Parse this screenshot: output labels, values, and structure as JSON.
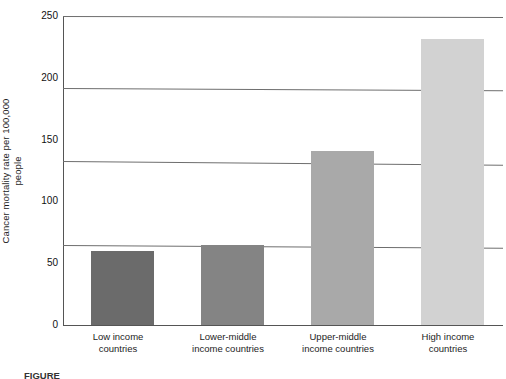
{
  "chart_data": {
    "type": "bar",
    "title": "",
    "xlabel": "",
    "ylabel": "Cancer mortality rate per 100,000\npeople",
    "categories": [
      "Low income\ncountries",
      "Lower-middle\nincome countries",
      "Upper-middle\nincome countries",
      "High income\ncountries"
    ],
    "values": [
      60,
      65,
      141,
      231
    ],
    "ylim": [
      0,
      250
    ],
    "yticks": [
      0,
      50,
      100,
      150,
      200,
      250
    ],
    "ytick_labels": [
      "0",
      "50",
      "100",
      "150",
      "200",
      "250"
    ],
    "gridlines": [
      65,
      133,
      192,
      250
    ],
    "grid": true,
    "legend": "none",
    "bar_colors": [
      "#6b6b6b",
      "#848484",
      "#a9a9a9",
      "#d2d2d2"
    ]
  },
  "axis": {
    "y_title": "Cancer mortality rate per 100,000\npeople"
  },
  "caption": {
    "prefix": "FIGURE",
    "text": ""
  }
}
